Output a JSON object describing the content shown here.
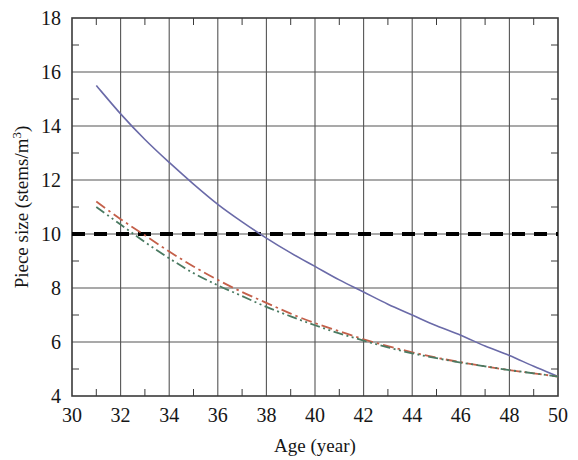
{
  "chart_data": {
    "type": "line",
    "title": "",
    "xlabel": "Age (year)",
    "ylabel": "Piece size (stems/m",
    "ylabel_sup": "3",
    "ylabel_suffix": ")",
    "ylabel_full": "Piece size (stems/m3)",
    "xlim": [
      30,
      50
    ],
    "ylim": [
      4,
      18
    ],
    "xticks": [
      30,
      32,
      34,
      36,
      38,
      40,
      42,
      44,
      46,
      48,
      50
    ],
    "yticks": [
      4,
      6,
      8,
      10,
      12,
      14,
      16,
      18
    ],
    "xtick_labels": [
      "30",
      "32",
      "34",
      "36",
      "38",
      "40",
      "42",
      "44",
      "46",
      "48",
      "50"
    ],
    "ytick_labels": [
      "4",
      "6",
      "8",
      "10",
      "12",
      "14",
      "16",
      "18"
    ],
    "xminor_step": 1,
    "yminor_step": 1,
    "grid": true,
    "grid_color": "#555555",
    "legend": "none",
    "series": [
      {
        "name": "curve-solid-blue",
        "color": "#6a6aa8",
        "style": "solid",
        "width": 1.6,
        "x": [
          31,
          32,
          33,
          34,
          35,
          36,
          37,
          38,
          39,
          40,
          41,
          42,
          43,
          44,
          45,
          46,
          47,
          48,
          49,
          50
        ],
        "y": [
          15.5,
          14.45,
          13.5,
          12.65,
          11.85,
          11.1,
          10.45,
          9.85,
          9.3,
          8.8,
          8.3,
          7.85,
          7.4,
          7.0,
          6.6,
          6.25,
          5.85,
          5.5,
          5.1,
          4.72
        ]
      },
      {
        "name": "curve-dashdot-red",
        "color": "#c4604a",
        "style": "dashdot",
        "width": 1.8,
        "x": [
          31,
          32,
          33,
          34,
          35,
          36,
          37,
          38,
          39,
          40,
          41,
          42,
          43,
          44,
          45,
          46,
          47,
          48,
          49,
          50
        ],
        "y": [
          11.2,
          10.55,
          9.95,
          9.35,
          8.8,
          8.3,
          7.85,
          7.45,
          7.05,
          6.7,
          6.4,
          6.1,
          5.85,
          5.62,
          5.42,
          5.25,
          5.1,
          4.96,
          4.84,
          4.72
        ]
      },
      {
        "name": "curve-dashdotdot-green",
        "color": "#4a7a62",
        "style": "dashdotdot",
        "width": 1.8,
        "x": [
          31,
          32,
          33,
          34,
          35,
          36,
          37,
          38,
          39,
          40,
          41,
          42,
          43,
          44,
          45,
          46,
          47,
          48,
          49,
          50
        ],
        "y": [
          11.0,
          10.35,
          9.7,
          9.1,
          8.55,
          8.1,
          7.7,
          7.3,
          6.95,
          6.62,
          6.32,
          6.05,
          5.8,
          5.58,
          5.4,
          5.24,
          5.1,
          4.96,
          4.84,
          4.72
        ]
      }
    ],
    "reference_lines": [
      {
        "name": "threshold-line",
        "orientation": "horizontal",
        "value": 10,
        "color": "#000000",
        "style": "dashed",
        "width": 4
      }
    ]
  },
  "axes": {
    "x_axis_name": "Age (year)",
    "y_axis_name": "Piece size (stems/m3)"
  }
}
